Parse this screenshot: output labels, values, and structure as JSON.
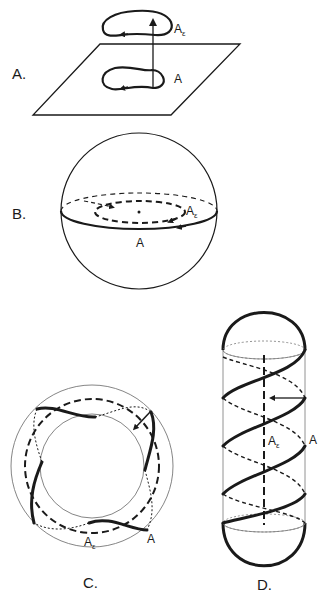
{
  "figure": {
    "panels": [
      {
        "id": "A",
        "label": "A.",
        "description": "Plane with loop A and lifted loop A-epsilon connected by vertical arrow",
        "curve_labels": {
          "base": "A",
          "lifted_main": "A",
          "lifted_sub": "ε"
        }
      },
      {
        "id": "B",
        "label": "B.",
        "description": "Sphere with equator loop A and inner dashed loop A-epsilon around center point",
        "curve_labels": {
          "base": "A",
          "lifted_main": "A",
          "lifted_sub": "ε"
        }
      },
      {
        "id": "C",
        "label": "C.",
        "description": "Annulus with wavy loop A and dashed circle A-epsilon",
        "curve_labels": {
          "base": "A",
          "lifted_main": "A",
          "lifted_sub": "ε"
        }
      },
      {
        "id": "D",
        "label": "D.",
        "description": "Capsule (cylinder with hemispherical caps) with helical curve A and dashed axis A-epsilon",
        "curve_labels": {
          "base": "A",
          "lifted_main": "A",
          "lifted_sub": "ε"
        }
      }
    ]
  },
  "colors": {
    "ink": "#1a1a1a",
    "thin_line": "#777777",
    "background": "#ffffff"
  }
}
